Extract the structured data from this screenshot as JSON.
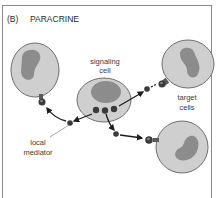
{
  "figure": {
    "panel_letter": "(B)",
    "title": "PARACRINE"
  },
  "labels": {
    "signaling_line1": "signaling",
    "signaling_line2": "cell",
    "target_line1": "target",
    "target_line2": "cells",
    "mediator_line1": "local",
    "mediator_line2": "mediator"
  },
  "colors": {
    "cell_fill": "#cfcfcf",
    "cell_stroke": "#6f6f6f",
    "nucleus": "#8c8c8c",
    "mediator": "#3a3a3a",
    "frame": "#8a8a8a"
  }
}
